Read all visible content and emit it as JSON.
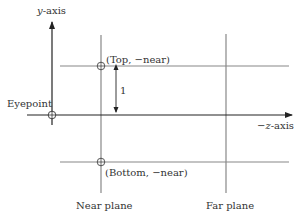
{
  "diagram": {
    "type": "perspective-view-frustum-side",
    "labels": {
      "y_axis": "y-axis",
      "y_axis_var": "y",
      "y_axis_suffix": "-axis",
      "z_axis_prefix": "−",
      "z_axis_var": "z",
      "z_axis_suffix": "-axis",
      "eyepoint": "Eyepoint",
      "top_point": "(Top, −near)",
      "bottom_point": "(Bottom, −near)",
      "distance": "1",
      "near_plane": "Near plane",
      "far_plane": "Far plane"
    },
    "colors": {
      "axis": "#222222",
      "line": "#888888",
      "text": "#333333"
    },
    "elements": [
      {
        "name": "y-axis",
        "kind": "arrow",
        "from": [
          52,
          125
        ],
        "to": [
          52,
          22
        ]
      },
      {
        "name": "z-axis",
        "kind": "arrow",
        "from": [
          27,
          115
        ],
        "to": [
          292,
          115
        ]
      },
      {
        "name": "near-plane",
        "kind": "line",
        "x": 101,
        "y1": 35,
        "y2": 193
      },
      {
        "name": "far-plane",
        "kind": "line",
        "x": 226,
        "y1": 34,
        "y2": 193
      },
      {
        "name": "top-line",
        "kind": "line",
        "y": 66,
        "x1": 60,
        "x2": 289
      },
      {
        "name": "bottom-line",
        "kind": "line",
        "y": 162,
        "x1": 60,
        "x2": 289
      },
      {
        "name": "eyepoint-marker",
        "kind": "circle",
        "cx": 52,
        "cy": 115
      },
      {
        "name": "top-marker",
        "kind": "circle",
        "cx": 101,
        "cy": 66
      },
      {
        "name": "bottom-marker",
        "kind": "circle",
        "cx": 101,
        "cy": 162
      },
      {
        "name": "unit-distance",
        "kind": "double-arrow",
        "x": 116,
        "y1": 66,
        "y2": 115
      }
    ]
  }
}
